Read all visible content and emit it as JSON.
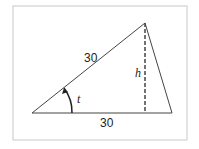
{
  "diagram": {
    "type": "triangle",
    "labels": {
      "side_hypotenuse": "30",
      "side_base": "30",
      "height": "h",
      "angle": "t"
    },
    "colors": {
      "frame": "#c8c8c8",
      "lines": "#444444"
    }
  }
}
